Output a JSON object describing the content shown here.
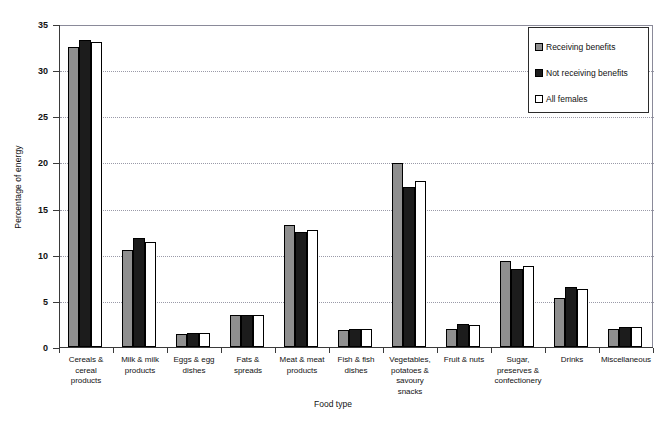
{
  "chart_data": {
    "type": "bar",
    "title": "",
    "xlabel": "Food type",
    "ylabel": "Percentage of energy",
    "ylim": [
      0,
      35
    ],
    "ytick_step": 5,
    "yticks": [
      "0",
      "5",
      "10",
      "15",
      "20",
      "25",
      "30",
      "35"
    ],
    "grid": true,
    "legend_position": "top-right",
    "categories": [
      "Cereals & cereal products",
      "Milk & milk products",
      "Eggs & egg dishes",
      "Fats & spreads",
      "Meat & meat products",
      "Fish & fish dishes",
      "Vegetables, potatoes & savoury snacks",
      "Fruit & nuts",
      "Sugar, preserves & confectionery",
      "Drinks",
      "Miscellaneous"
    ],
    "category_lines": [
      [
        "Cereals &",
        "cereal",
        "products"
      ],
      [
        "Milk & milk",
        "products"
      ],
      [
        "Eggs & egg",
        "dishes"
      ],
      [
        "Fats &",
        "spreads"
      ],
      [
        "Meat & meat",
        "products"
      ],
      [
        "Fish & fish",
        "dishes"
      ],
      [
        "Vegetables,",
        "potatoes &",
        "savoury",
        "snacks"
      ],
      [
        "Fruit & nuts"
      ],
      [
        "Sugar,",
        "preserves &",
        "confectionery"
      ],
      [
        "Drinks"
      ],
      [
        "Miscellaneous"
      ]
    ],
    "series": [
      {
        "name": "Receiving benefits",
        "color": "#8f8f8f",
        "values": [
          32.5,
          10.5,
          1.4,
          3.5,
          13.2,
          1.8,
          19.9,
          2.0,
          9.3,
          5.3,
          1.9
        ]
      },
      {
        "name": "Not receiving benefits",
        "color": "#1c1c1c",
        "values": [
          33.3,
          11.8,
          1.5,
          3.5,
          12.5,
          1.9,
          17.3,
          2.5,
          8.5,
          6.5,
          2.2
        ]
      },
      {
        "name": "All females",
        "color": "#ffffff",
        "values": [
          33.1,
          11.4,
          1.5,
          3.5,
          12.7,
          1.9,
          18.0,
          2.4,
          8.8,
          6.3,
          2.2
        ]
      }
    ]
  }
}
